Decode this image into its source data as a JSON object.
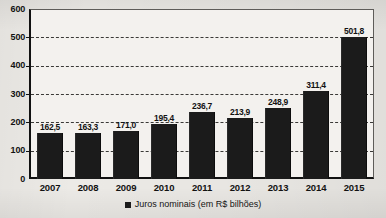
{
  "chart_data": {
    "type": "bar",
    "title": "",
    "subtitle": "",
    "xlabel": "",
    "ylabel": "",
    "categories": [
      "2007",
      "2008",
      "2009",
      "2010",
      "2011",
      "2012",
      "2013",
      "2014",
      "2015"
    ],
    "values": [
      162.5,
      163.3,
      171.0,
      195.4,
      236.7,
      213.9,
      248.9,
      311.4,
      501.8
    ],
    "value_labels": [
      "162,5",
      "163,3",
      "171,0",
      "195,4",
      "236,7",
      "213,9",
      "248,9",
      "311,4",
      "501,8"
    ],
    "series": [
      {
        "name": "Juros nominais (em R$ bilhões)",
        "values": [
          162.5,
          163.3,
          171.0,
          195.4,
          236.7,
          213.9,
          248.9,
          311.4,
          501.8
        ],
        "color": "#1b1b1b"
      }
    ],
    "ylim": [
      0,
      600
    ],
    "ytick_values": [
      0,
      100,
      200,
      300,
      400,
      500,
      600
    ],
    "ytick_labels": [
      "0",
      "100",
      "200",
      "300",
      "400",
      "500",
      "600"
    ],
    "gridline_values": [
      100,
      200,
      300,
      400,
      500
    ],
    "grid": true,
    "grid_style": "dashed-horizontal",
    "legend_position": "bottom-center"
  },
  "legend": {
    "marker": "square-marker",
    "label": "Juros nominais (em R$ bilhões)"
  },
  "colors": {
    "bar": "#1b1b1b",
    "axis": "#111111",
    "grid": "#2b2a28",
    "plot_background": "#f3f1ee",
    "page_background": "#eceae6",
    "text": "#121212"
  }
}
